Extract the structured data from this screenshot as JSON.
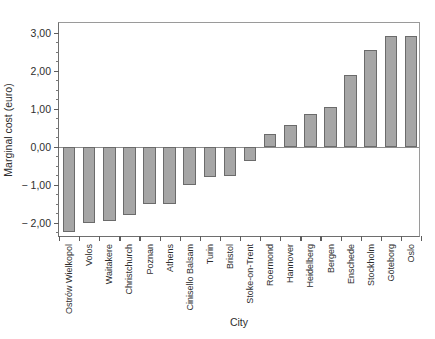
{
  "chart_data": {
    "type": "bar",
    "title": "",
    "xlabel": "City",
    "ylabel": "Marginal cost (euro)",
    "ylim": [
      -2.4,
      3.25
    ],
    "grid": false,
    "legend": null,
    "ytick_labels": [
      "3,00",
      "2,00",
      "1,00",
      "0,00",
      "− 1,00",
      "− 2,00"
    ],
    "ytick_values": [
      3.0,
      2.0,
      1.0,
      0.0,
      -1.0,
      -2.0
    ],
    "bar_color": "#a6a6a6",
    "bar_edge_color": "#6b6b6b",
    "categories": [
      "Ostrów Wielkopol",
      "Volos",
      "Waitakere",
      "Christchurch",
      "Poznan",
      "Athens",
      "Cinisello Balsam",
      "Turin",
      "Bristol",
      "Stoke-on-Trent",
      "Roermond",
      "Hannover",
      "Heidelberg",
      "Bergen",
      "Enschede",
      "Stockholm",
      "Göteborg",
      "Oslo"
    ],
    "values": [
      -2.25,
      -2.0,
      -1.95,
      -1.8,
      -1.5,
      -1.5,
      -1.0,
      -0.8,
      -0.78,
      -0.38,
      0.32,
      0.58,
      0.85,
      1.05,
      1.88,
      2.55,
      2.9,
      2.9
    ]
  }
}
